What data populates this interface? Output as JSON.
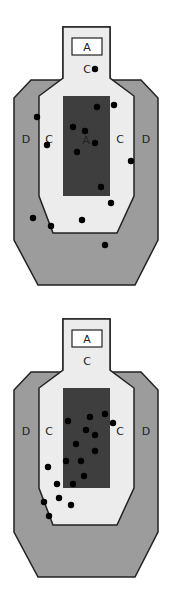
{
  "colors": {
    "zone_d": "#9c9c9c",
    "zone_c": "#ececec",
    "zone_a": "#3e3e3e",
    "outline": "#222222",
    "hit": "#000000",
    "head_box": "#ffffff"
  },
  "targets": [
    {
      "offset_y": 0,
      "labels": {
        "head_a": "A",
        "head_c": "C",
        "body_a": "A",
        "left_d": "D",
        "left_c": "C",
        "right_c": "C",
        "right_d": "D"
      },
      "hits": [
        [
          95,
          69
        ],
        [
          97,
          107
        ],
        [
          114,
          105
        ],
        [
          37,
          117
        ],
        [
          73,
          127
        ],
        [
          85,
          131
        ],
        [
          95,
          143
        ],
        [
          47,
          145
        ],
        [
          77,
          152
        ],
        [
          131,
          161
        ],
        [
          101,
          187
        ],
        [
          111,
          203
        ],
        [
          33,
          218
        ],
        [
          82,
          220
        ],
        [
          51,
          226
        ],
        [
          105,
          245
        ]
      ]
    },
    {
      "offset_y": 292,
      "labels": {
        "head_a": "A",
        "head_c": "C",
        "body_a": "",
        "left_d": "D",
        "left_c": "C",
        "right_c": "C",
        "right_d": "D"
      },
      "hits": [
        [
          105,
          122
        ],
        [
          90,
          125
        ],
        [
          68,
          129
        ],
        [
          113,
          131
        ],
        [
          86,
          138
        ],
        [
          95,
          143
        ],
        [
          76,
          152
        ],
        [
          95,
          159
        ],
        [
          66,
          169
        ],
        [
          81,
          169
        ],
        [
          84,
          184
        ],
        [
          48,
          175
        ],
        [
          57,
          192
        ],
        [
          73,
          192
        ],
        [
          59,
          206
        ],
        [
          44,
          210
        ],
        [
          71,
          213
        ],
        [
          49,
          224
        ]
      ]
    }
  ]
}
